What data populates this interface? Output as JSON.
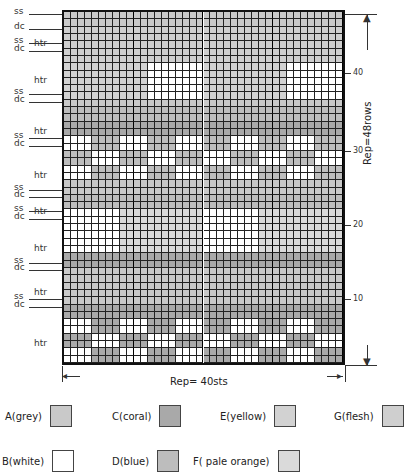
{
  "chart": {
    "columns": 40,
    "rows": 48,
    "rep_rows_label": "Rep=48rows",
    "rep_sts_label": "Rep= 40sts",
    "row_numbers": [
      "10",
      "20",
      "30",
      "40"
    ]
  },
  "stitch_labels": [
    {
      "text": "ss",
      "row_top": 48
    },
    {
      "text": "dc",
      "row_top": 46
    },
    {
      "text": "htr",
      "row_top": 45
    },
    {
      "text": "ss",
      "row_top": 44
    },
    {
      "text": "dc",
      "row_top": 43
    },
    {
      "text": "htr",
      "row_top": 40
    },
    {
      "text": "ss",
      "row_top": 37
    },
    {
      "text": "dc",
      "row_top": 36
    },
    {
      "text": "htr",
      "row_top": 33
    },
    {
      "text": "ss",
      "row_top": 31
    },
    {
      "text": "dc",
      "row_top": 30
    },
    {
      "text": "htr",
      "row_top": 27
    },
    {
      "text": "ss",
      "row_top": 24
    },
    {
      "text": "dc",
      "row_top": 23
    },
    {
      "text": "htr",
      "row_top": 22
    },
    {
      "text": "ss",
      "row_top": 21
    },
    {
      "text": "dc",
      "row_top": 20
    },
    {
      "text": "htr",
      "row_top": 17
    },
    {
      "text": "ss",
      "row_top": 14
    },
    {
      "text": "dc",
      "row_top": 13
    },
    {
      "text": "htr",
      "row_top": 11
    },
    {
      "text": "ss",
      "row_top": 9
    },
    {
      "text": "dc",
      "row_top": 8
    },
    {
      "text": "htr",
      "row_top": 4
    }
  ],
  "colors": {
    "A": "#c9c9c9",
    "B": "#ffffff",
    "C": "#a9a9a9",
    "D": "#bdbdbd",
    "E": "#d2d2d2",
    "F": "#dadada",
    "G": "#cfcfcf"
  },
  "key": [
    {
      "code": "A",
      "label": "A(grey)",
      "color": "#c9c9c9"
    },
    {
      "code": "C",
      "label": "C(coral)",
      "color": "#a9a9a9"
    },
    {
      "code": "E",
      "label": "E(yellow)",
      "color": "#d2d2d2"
    },
    {
      "code": "G",
      "label": "G(flesh)",
      "color": "#cfcfcf"
    },
    {
      "code": "B",
      "label": "B(white)",
      "color": "#ffffff"
    },
    {
      "code": "D",
      "label": "D(blue)",
      "color": "#bdbdbd"
    },
    {
      "code": "F",
      "label": "F( pale orange)",
      "color": "#dadada"
    }
  ]
}
